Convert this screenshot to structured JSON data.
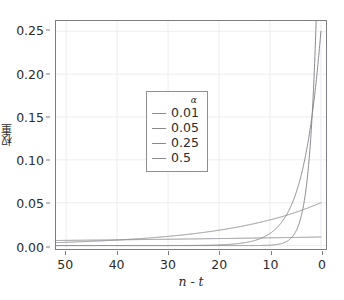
{
  "top_caption": "",
  "chart_data": {
    "type": "line",
    "title": "",
    "xlabel": "n - t",
    "ylabel": "权重",
    "xlim": [
      52,
      -1
    ],
    "ylim": [
      -0.004,
      0.262
    ],
    "x_reversed": true,
    "grid": true,
    "grid_color": "#ededf0",
    "frame_color": "#7d7d84",
    "background": "#ffffff",
    "xticks": [
      50,
      40,
      30,
      20,
      10,
      0
    ],
    "xtick_labels": [
      "50",
      "40",
      "30",
      "20",
      "10",
      "0"
    ],
    "yticks": [
      0.0,
      0.05,
      0.1,
      0.15,
      0.2,
      0.25
    ],
    "ytick_labels": [
      "0.00",
      "0.05",
      "0.10",
      "0.15",
      "0.20",
      "0.25"
    ],
    "legend": {
      "title": "α",
      "position": "upper-center-left",
      "entries": [
        {
          "label": "0.01",
          "color": "#8a8a90"
        },
        {
          "label": "0.05",
          "color": "#8a8a90"
        },
        {
          "label": "0.25",
          "color": "#8a8a90"
        },
        {
          "label": "0.5",
          "color": "#8a8a90"
        }
      ]
    },
    "series": [
      {
        "name": "0.01",
        "alpha": 0.01,
        "color": "#8a8a90",
        "formula": "alpha * (1 - alpha)^(n - t)",
        "x": [
          50,
          45,
          40,
          35,
          30,
          25,
          20,
          15,
          10,
          8,
          6,
          5,
          4,
          3,
          2,
          1,
          0
        ],
        "y": [
          0.00605,
          0.00636,
          0.00669,
          0.00703,
          0.0074,
          0.00778,
          0.00818,
          0.0086,
          0.00904,
          0.00923,
          0.00941,
          0.00951,
          0.00961,
          0.0097,
          0.0098,
          0.0099,
          0.01
        ]
      },
      {
        "name": "0.05",
        "alpha": 0.05,
        "color": "#8a8a90",
        "formula": "alpha * (1 - alpha)^(n - t)",
        "x": [
          50,
          45,
          40,
          35,
          30,
          25,
          20,
          15,
          10,
          8,
          6,
          5,
          4,
          3,
          2,
          1,
          0
        ],
        "y": [
          0.00385,
          0.00497,
          0.00642,
          0.00829,
          0.01071,
          0.01383,
          0.01786,
          0.02307,
          0.0298,
          0.033,
          0.03654,
          0.03845,
          0.04048,
          0.04261,
          0.04512,
          0.0475,
          0.05
        ]
      },
      {
        "name": "0.25",
        "alpha": 0.25,
        "color": "#8a8a90",
        "formula": "alpha * (1 - alpha)^(n - t)",
        "x": [
          30,
          25,
          22,
          20,
          18,
          16,
          14,
          12,
          10,
          9,
          8,
          7,
          6,
          5,
          4,
          3,
          2,
          1,
          0
        ],
        "y": [
          4.56e-05,
          0.000162,
          0.000342,
          0.000608,
          0.001082,
          0.001925,
          0.003424,
          0.006092,
          0.010838,
          0.014451,
          0.019268,
          0.02569,
          0.034254,
          0.045673,
          0.060897,
          0.081196,
          0.108262,
          0.144349,
          0.192499
        ]
      },
      {
        "name": "0.5",
        "alpha": 0.5,
        "color": "#8a8a90",
        "formula": "alpha * (1 - alpha)^(n - t)",
        "x": [
          16,
          14,
          12,
          11,
          10,
          9,
          8,
          7,
          6,
          5,
          4,
          3,
          2,
          1,
          0
        ],
        "y": [
          7.6e-06,
          3.05e-05,
          0.000122,
          0.000244,
          0.000488,
          0.000977,
          0.001953,
          0.003906,
          0.007813,
          0.015625,
          0.03125,
          0.0625,
          0.125,
          0.25,
          0.5
        ]
      }
    ]
  }
}
